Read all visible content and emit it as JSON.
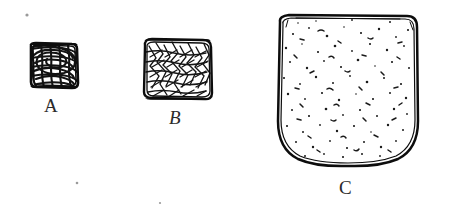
{
  "figure": {
    "background_color": "#ffffff",
    "ink_color": "#1a1a1a",
    "width": 450,
    "height": 216,
    "specimens": [
      {
        "id": "A",
        "label": "A",
        "description": "small square specimen with dense scribbled interior",
        "fill_style": "dense-scribble",
        "x": 30,
        "y": 43,
        "width": 48,
        "height": 45,
        "corner_radius": 4,
        "label_x": 44,
        "label_y": 96
      },
      {
        "id": "B",
        "label": "B",
        "description": "medium square specimen with angular hatched interior",
        "fill_style": "angular-hatch",
        "x": 143,
        "y": 38,
        "width": 69,
        "height": 62,
        "corner_radius": 7,
        "label_x": 169,
        "label_y": 108
      },
      {
        "id": "C",
        "label": "C",
        "description": "large rounded square specimen with stippled interior",
        "fill_style": "stipple",
        "x": 278,
        "y": 15,
        "width": 140,
        "height": 150,
        "corner_radius": 34,
        "label_x": 339,
        "label_y": 178
      }
    ],
    "stray_marks": [
      {
        "x": 27,
        "y": 15,
        "size": 1.6
      },
      {
        "x": 77,
        "y": 183,
        "size": 1.3
      },
      {
        "x": 160,
        "y": 203,
        "size": 1.1
      }
    ]
  }
}
